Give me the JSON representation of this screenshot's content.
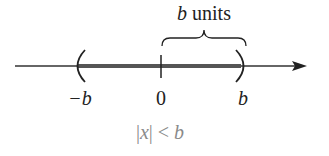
{
  "diagram": {
    "type": "number-line",
    "brace_label": {
      "var": "b",
      "text": " units"
    },
    "ticks": [
      {
        "label": "−b",
        "position": -1,
        "endpoint": "open-paren-left"
      },
      {
        "label": "0",
        "position": 0,
        "endpoint": "tick"
      },
      {
        "label": "b",
        "position": 1,
        "endpoint": "open-paren-right"
      }
    ],
    "shaded_interval": {
      "from": "−b",
      "to": "b",
      "open_left": true,
      "open_right": true
    },
    "caption": {
      "left": "|",
      "var": "x",
      "right": "| < ",
      "rhs": "b"
    },
    "colors": {
      "axis": "#333333",
      "shaded": "#555555",
      "caption": "#8a8a8a"
    }
  }
}
